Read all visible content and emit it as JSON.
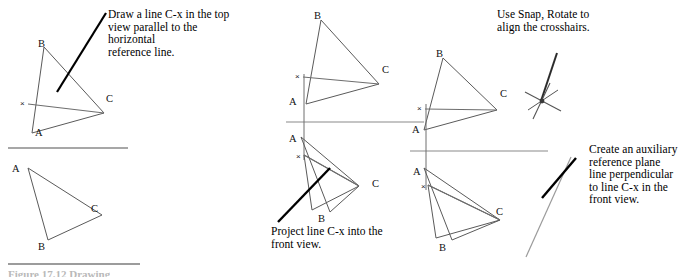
{
  "figure": {
    "number_text": "Figure 17.12 Drawing",
    "panels": [
      {
        "id": "panel-1",
        "views": [
          {
            "id": "top-view",
            "labels": [
              {
                "name": "vertex-label-b",
                "text": "B",
                "x": 38,
                "y": 38
              },
              {
                "name": "vertex-label-c",
                "text": "C",
                "x": 106,
                "y": 93
              },
              {
                "name": "vertex-label-a",
                "text": "A",
                "x": 35,
                "y": 127
              },
              {
                "name": "point-label-x",
                "text": "×",
                "x": 20,
                "y": 99
              }
            ]
          },
          {
            "id": "front-view",
            "labels": [
              {
                "name": "vertex-label-a",
                "text": "A",
                "x": 12,
                "y": 163
              },
              {
                "name": "vertex-label-c",
                "text": "C",
                "x": 91,
                "y": 203
              },
              {
                "name": "vertex-label-b",
                "text": "B",
                "x": 38,
                "y": 241
              }
            ]
          }
        ]
      },
      {
        "id": "panel-2",
        "views": [
          {
            "id": "top-view",
            "labels": [
              {
                "name": "vertex-label-b",
                "text": "B",
                "x": 314,
                "y": 10
              },
              {
                "name": "vertex-label-c",
                "text": "C",
                "x": 382,
                "y": 64
              },
              {
                "name": "vertex-label-a",
                "text": "A",
                "x": 289,
                "y": 96
              },
              {
                "name": "point-label-x",
                "text": "×",
                "x": 295,
                "y": 72
              }
            ]
          },
          {
            "id": "front-view",
            "labels": [
              {
                "name": "vertex-label-a",
                "text": "A",
                "x": 289,
                "y": 133
              },
              {
                "name": "point-label-x",
                "text": "×",
                "x": 296,
                "y": 152
              },
              {
                "name": "vertex-label-c",
                "text": "C",
                "x": 372,
                "y": 178
              },
              {
                "name": "vertex-label-b",
                "text": "B",
                "x": 318,
                "y": 213
              }
            ]
          }
        ]
      },
      {
        "id": "panel-3",
        "views": [
          {
            "id": "top-view",
            "labels": [
              {
                "name": "vertex-label-b",
                "text": "B",
                "x": 436,
                "y": 48
              },
              {
                "name": "vertex-label-c",
                "text": "C",
                "x": 500,
                "y": 88
              },
              {
                "name": "vertex-label-a",
                "text": "A",
                "x": 412,
                "y": 124
              },
              {
                "name": "point-label-x",
                "text": "×",
                "x": 417,
                "y": 104
              }
            ]
          },
          {
            "id": "front-view",
            "labels": [
              {
                "name": "vertex-label-a",
                "text": "A",
                "x": 413,
                "y": 166
              },
              {
                "name": "point-label-x",
                "text": "×",
                "x": 421,
                "y": 182
              },
              {
                "name": "vertex-label-c",
                "text": "C",
                "x": 496,
                "y": 206
              },
              {
                "name": "vertex-label-b",
                "text": "B",
                "x": 439,
                "y": 242
              }
            ]
          }
        ]
      }
    ]
  },
  "captions": {
    "step1": "Draw a line C-x in the top\nview parallel to the horizontal\nreference line.",
    "step2": "Project line C-x into the\nfront view.",
    "step3": "Use Snap, Rotate to\nalign the crosshairs.",
    "step4": "Create an auxiliary\nreference plane\nline perpendicular\nto line C-x in the\nfront view."
  },
  "colors": {
    "object_line": "#5a5a5a",
    "emphasis_line": "#000000",
    "reference_line": "#8a8a8a",
    "text": "#000000"
  }
}
